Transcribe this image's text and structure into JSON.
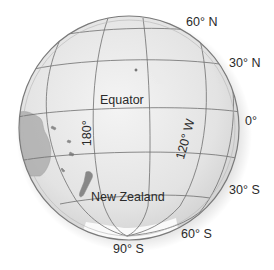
{
  "diagram": {
    "colors": {
      "ocean": "#e6e6e6",
      "ocean_highlight": "#f4f4f4",
      "grid_line": "#6e6e6e",
      "land": "#9a9a9a",
      "rim": "#7a7a7a",
      "ice": "#fafafa",
      "text": "#2a2a2a"
    },
    "latitude_labels": {
      "lat_60n": "60° N",
      "lat_30n": "30° N",
      "lat_0": "0°",
      "lat_30s": "30° S",
      "lat_60s": "60° S",
      "lat_90s": "90° S"
    },
    "longitude_labels": {
      "lon_180": "180°",
      "lon_120w": "120° W"
    },
    "feature_labels": {
      "equator": "Equator",
      "new_zealand": "New Zealand"
    }
  }
}
